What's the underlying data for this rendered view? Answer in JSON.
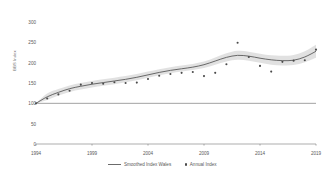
{
  "chart_data": {
    "type": "line",
    "title": "",
    "xlabel": "",
    "ylabel": "BBS Index",
    "xlim": [
      1994,
      2019
    ],
    "ylim": [
      0,
      300
    ],
    "grid": false,
    "legend_position": "bottom",
    "yticks": [
      0,
      50,
      100,
      150,
      200,
      250,
      300
    ],
    "xticks": [
      1994,
      1999,
      2004,
      2009,
      2014,
      2019
    ],
    "reference_line": {
      "value": 100,
      "label": ""
    },
    "x": [
      1994,
      1995,
      1996,
      1997,
      1998,
      1999,
      2000,
      2001,
      2002,
      2003,
      2004,
      2005,
      2006,
      2007,
      2008,
      2009,
      2010,
      2011,
      2012,
      2013,
      2014,
      2015,
      2016,
      2017,
      2018,
      2019
    ],
    "series": [
      {
        "name": "Smoothed Index Wales",
        "type": "line",
        "color": "#5a5a5a",
        "values": [
          100,
          116,
          127,
          136,
          142,
          147,
          151,
          155,
          159,
          164,
          170,
          176,
          181,
          185,
          189,
          195,
          204,
          213,
          218,
          216,
          211,
          207,
          205,
          206,
          214,
          228
        ]
      },
      {
        "name": "Annual Index",
        "type": "scatter",
        "color": "#4a4a4a",
        "values": [
          100,
          112,
          122,
          131,
          146,
          150,
          148,
          152,
          150,
          151,
          160,
          168,
          172,
          175,
          177,
          167,
          175,
          196,
          249,
          214,
          192,
          178,
          202,
          205,
          206,
          232
        ]
      }
    ],
    "confidence_band": {
      "name": "Smoothed Index confidence interval",
      "color": "#d9d9d9",
      "lower": [
        100,
        108,
        119,
        128,
        134,
        139,
        143,
        147,
        152,
        157,
        163,
        169,
        174,
        178,
        182,
        187,
        195,
        203,
        207,
        205,
        200,
        195,
        193,
        194,
        201,
        212
      ],
      "upper": [
        100,
        124,
        135,
        144,
        150,
        155,
        159,
        163,
        167,
        172,
        178,
        184,
        189,
        193,
        197,
        203,
        213,
        223,
        229,
        227,
        222,
        218,
        217,
        219,
        228,
        244
      ]
    }
  },
  "legend": {
    "items": [
      {
        "label": "Smoothed Index Wales",
        "marker": "line"
      },
      {
        "label": "Annual Index",
        "marker": "dot"
      }
    ]
  }
}
